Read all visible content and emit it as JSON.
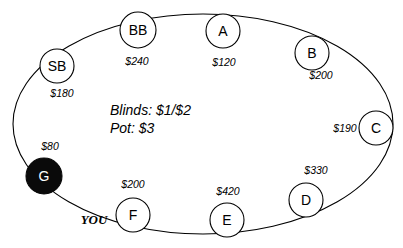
{
  "diagram": {
    "center_info": {
      "blinds_line": "Blinds: $1/$2",
      "pot_line": "Pot: $3"
    },
    "hero_marker": "YOU",
    "colors": {
      "stroke": "#000000",
      "seat_fill": "#ffffff",
      "dealer_fill": "#0a0a0a",
      "dealer_text": "#ffffff",
      "background": "#ffffff"
    },
    "seats": [
      {
        "id": "sb",
        "label": "SB",
        "stack": "$180",
        "cx": 57,
        "cy": 66,
        "r": 17,
        "font_size": 14,
        "filled": false,
        "stack_x": 62,
        "stack_y": 93,
        "is_hero": false
      },
      {
        "id": "bb",
        "label": "BB",
        "stack": "$240",
        "cx": 138,
        "cy": 30,
        "r": 18,
        "font_size": 14,
        "filled": false,
        "stack_x": 137,
        "stack_y": 61,
        "is_hero": false
      },
      {
        "id": "a",
        "label": "A",
        "stack": "$120",
        "cx": 223,
        "cy": 31,
        "r": 17,
        "font_size": 14,
        "filled": false,
        "stack_x": 224,
        "stack_y": 62,
        "is_hero": false
      },
      {
        "id": "b",
        "label": "B",
        "stack": "$200",
        "cx": 312,
        "cy": 53,
        "r": 17,
        "font_size": 14,
        "filled": false,
        "stack_x": 321,
        "stack_y": 75,
        "is_hero": false
      },
      {
        "id": "c",
        "label": "C",
        "stack": "$190",
        "cx": 376,
        "cy": 128,
        "r": 17,
        "font_size": 14,
        "filled": false,
        "stack_x": 345,
        "stack_y": 128,
        "is_hero": false
      },
      {
        "id": "d",
        "label": "D",
        "stack": "$330",
        "cx": 306,
        "cy": 200,
        "r": 17,
        "font_size": 14,
        "filled": false,
        "stack_x": 316,
        "stack_y": 170,
        "is_hero": false
      },
      {
        "id": "e",
        "label": "E",
        "stack": "$420",
        "cx": 227,
        "cy": 220,
        "r": 17,
        "font_size": 14,
        "filled": false,
        "stack_x": 228,
        "stack_y": 191,
        "is_hero": false
      },
      {
        "id": "f",
        "label": "F",
        "stack": "$200",
        "cx": 133,
        "cy": 215,
        "r": 17,
        "font_size": 14,
        "filled": false,
        "stack_x": 133,
        "stack_y": 184,
        "is_hero": true
      },
      {
        "id": "g",
        "label": "G",
        "stack": "$80",
        "cx": 44,
        "cy": 176,
        "r": 18,
        "font_size": 14,
        "filled": true,
        "stack_x": 50,
        "stack_y": 146,
        "is_hero": false
      }
    ],
    "center_text_x": 110,
    "center_text_y_blinds": 110,
    "center_text_y_pot": 128,
    "you_x": 94,
    "you_y": 219,
    "ring": {
      "cx": 203,
      "cy": 124,
      "rx": 190,
      "ry": 110
    }
  }
}
